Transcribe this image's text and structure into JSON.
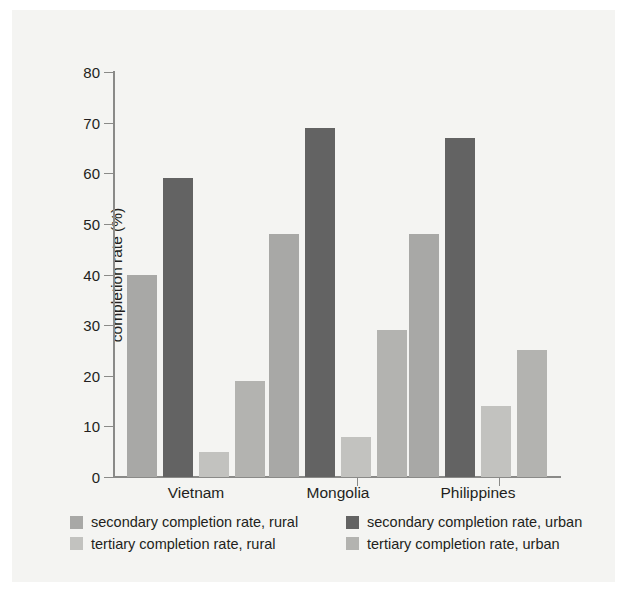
{
  "chart_data": {
    "type": "bar",
    "title": "",
    "xlabel": "",
    "ylabel": "completion rate (%)",
    "ylim": [
      0,
      80
    ],
    "yticks": [
      0,
      10,
      20,
      30,
      40,
      50,
      60,
      70,
      80
    ],
    "ytick_labels": [
      "0",
      "10",
      "20",
      "30",
      "40",
      "50",
      "60",
      "70",
      "80"
    ],
    "grid": false,
    "legend_position": "bottom",
    "categories": [
      "Vietnam",
      "Mongolia",
      "Philippines"
    ],
    "series": [
      {
        "name": "secondary completion rate, rural",
        "color": "#a8a8a6",
        "values": [
          40,
          48,
          48
        ]
      },
      {
        "name": "secondary completion rate, urban",
        "color": "#636363",
        "values": [
          59,
          69,
          67
        ]
      },
      {
        "name": "tertiary completion rate, rural",
        "color": "#c2c2bf",
        "values": [
          5,
          8,
          14
        ]
      },
      {
        "name": "tertiary completion rate, urban",
        "color": "#b3b3b0",
        "values": [
          19,
          29,
          25
        ]
      }
    ]
  },
  "axis": {
    "y_title": "completion rate (%)",
    "ticks": [
      "80",
      "70",
      "60",
      "50",
      "40",
      "30",
      "20",
      "10",
      "0"
    ]
  },
  "xlabels": {
    "c0": "Vietnam",
    "c1": "Mongolia",
    "c2": "Philippines"
  },
  "legend": {
    "e0": "secondary completion rate, rural",
    "e1": "secondary completion rate, urban",
    "e2": "tertiary completion rate, rural",
    "e3": "tertiary completion rate, urban"
  },
  "colors": {
    "secondary_rural": "#a8a8a6",
    "secondary_urban": "#636363",
    "tertiary_rural": "#c2c2bf",
    "tertiary_urban": "#b3b3b0",
    "axis": "#8a8a88",
    "text": "#231f20",
    "panel_bg": "#f4f4f2"
  }
}
